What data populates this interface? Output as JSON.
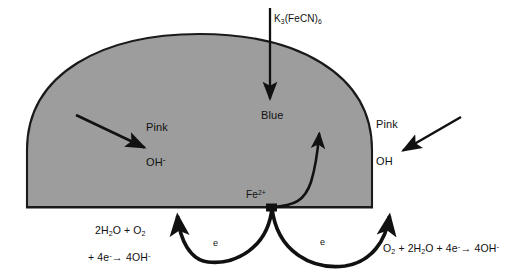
{
  "figure": {
    "type": "electrochemical-corrosion-diagram",
    "background_color": "#ffffff",
    "dome": {
      "name": "electrolyte-droplet",
      "fill_color": "#9d9d9d",
      "stroke_color": "#1a1a1a",
      "left_x": 27,
      "right_x": 372,
      "baseline_y": 207,
      "apex_y": 34
    }
  },
  "labels": {
    "top_reagent": "K",
    "top_reagent_sub1": "3",
    "top_reagent_mid": "(FeCN)",
    "top_reagent_sub2": "6",
    "center_zone": "Blue",
    "left_zone": "Pink",
    "left_species": "OH",
    "left_species_charge": "-",
    "right_zone": "Pink",
    "right_species": "OH",
    "iron_ion": "Fe",
    "iron_ion_charge": "2+",
    "electron_left": "e",
    "electron_right": "e"
  },
  "equations": {
    "left": {
      "line1_part1": "2H",
      "line1_sub1": "2",
      "line1_part2": "O + O",
      "line1_sub2": "2",
      "line2_part1": "+ 4e",
      "line2_sup1": "-",
      "line2_arrow": "→",
      "line2_part2": " 4OH",
      "line2_sup2": "-"
    },
    "right": {
      "part1": "O",
      "sub1": "2",
      "part2": " + 2H",
      "sub2": "2",
      "part3": "O + 4e",
      "sup1": "-",
      "arrow": "→",
      "part4": " 4OH",
      "sup2": "-"
    }
  },
  "arrows": [
    {
      "name": "ferricyanide-inlet-arrow",
      "direction": "down",
      "from": [
        270,
        8
      ],
      "to": [
        270,
        101
      ]
    },
    {
      "name": "left-hydroxide-arrow",
      "direction": "down-right",
      "from": [
        76,
        115
      ],
      "to": [
        147,
        149
      ]
    },
    {
      "name": "right-hydroxide-arrow",
      "direction": "down-left",
      "from": [
        461,
        117
      ],
      "to": [
        400,
        152
      ]
    },
    {
      "name": "iron-dissolution-arrow",
      "direction": "curved-up",
      "from": [
        272,
        207
      ],
      "to": [
        320,
        130
      ]
    },
    {
      "name": "electron-flow-left-arrow",
      "direction": "arc-left",
      "from": [
        272,
        207
      ],
      "to": [
        178,
        211
      ]
    },
    {
      "name": "electron-flow-right-arrow",
      "direction": "arc-right",
      "from": [
        272,
        207
      ],
      "to": [
        390,
        211
      ]
    }
  ],
  "colors": {
    "ink": "#111111",
    "dome_fill": "#9d9d9d",
    "outline": "#1a1a1a"
  }
}
